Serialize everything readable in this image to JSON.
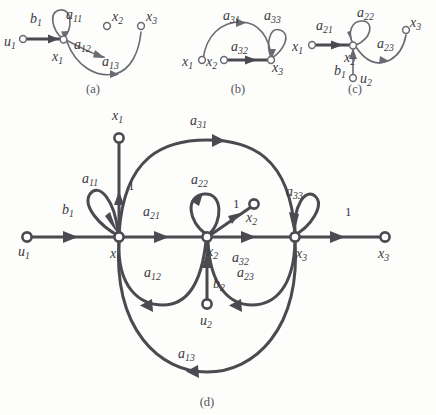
{
  "figure": {
    "background_color": "#fdfdfc",
    "edge_color": "#4a4a50",
    "text_color": "#3a3a40",
    "width": 436,
    "height": 415
  },
  "captions": {
    "a": "(a)",
    "b": "(b)",
    "c": "(c)",
    "d": "(d)"
  },
  "subfig_a": {
    "nodes": [
      {
        "id": "u1",
        "label": "u",
        "sub": "1"
      },
      {
        "id": "x1",
        "label": "x",
        "sub": "1"
      },
      {
        "id": "x2",
        "label": "x",
        "sub": "2"
      },
      {
        "id": "x3",
        "label": "x",
        "sub": "3"
      }
    ],
    "edges": [
      {
        "id": "b1",
        "label": "b",
        "sub": "1",
        "from": "u1",
        "to": "x1"
      },
      {
        "id": "a11",
        "label": "a",
        "sub": "11",
        "from": "x1",
        "to": "x1"
      },
      {
        "id": "a12",
        "label": "a",
        "sub": "12",
        "from": "x1",
        "to": "x2"
      },
      {
        "id": "a13",
        "label": "a",
        "sub": "13",
        "from": "x1",
        "to": "x3"
      }
    ]
  },
  "subfig_b": {
    "nodes": [
      {
        "id": "x1",
        "label": "x",
        "sub": "1"
      },
      {
        "id": "x2",
        "label": "x",
        "sub": "2"
      },
      {
        "id": "x3",
        "label": "x",
        "sub": "3"
      }
    ],
    "edges": [
      {
        "id": "a31",
        "label": "a",
        "sub": "31",
        "from": "x1",
        "to": "x3"
      },
      {
        "id": "a32",
        "label": "a",
        "sub": "32",
        "from": "x2",
        "to": "x3"
      },
      {
        "id": "a33",
        "label": "a",
        "sub": "33",
        "from": "x3",
        "to": "x3"
      }
    ]
  },
  "subfig_c": {
    "nodes": [
      {
        "id": "x1",
        "label": "x",
        "sub": "1"
      },
      {
        "id": "x2",
        "label": "x",
        "sub": "2"
      },
      {
        "id": "x3",
        "label": "x",
        "sub": "3"
      },
      {
        "id": "u2",
        "label": "u",
        "sub": "2"
      }
    ],
    "edges": [
      {
        "id": "a21",
        "label": "a",
        "sub": "21",
        "from": "x1",
        "to": "x2"
      },
      {
        "id": "a22",
        "label": "a",
        "sub": "22",
        "from": "x2",
        "to": "x2"
      },
      {
        "id": "a23",
        "label": "a",
        "sub": "23",
        "from": "x2",
        "to": "x3"
      },
      {
        "id": "b1",
        "label": "b",
        "sub": "1",
        "from": "u2",
        "to": "x2"
      }
    ]
  },
  "subfig_d": {
    "nodes": [
      {
        "id": "u1",
        "label": "u",
        "sub": "1"
      },
      {
        "id": "x1_node",
        "label": "x",
        "sub": "1"
      },
      {
        "id": "x2_node",
        "label": "x",
        "sub": "2"
      },
      {
        "id": "x3_node",
        "label": "x",
        "sub": "3"
      },
      {
        "id": "x1_out",
        "label": "x",
        "sub": "1"
      },
      {
        "id": "x2_out",
        "label": "x",
        "sub": "2"
      },
      {
        "id": "x3_out",
        "label": "x",
        "sub": "3"
      },
      {
        "id": "u2",
        "label": "u",
        "sub": "2"
      }
    ],
    "edges": [
      {
        "id": "b1",
        "label": "b",
        "sub": "1",
        "from": "u1",
        "to": "x1_node"
      },
      {
        "id": "a11",
        "label": "a",
        "sub": "11",
        "from": "x1_node",
        "to": "x1_node"
      },
      {
        "id": "a21",
        "label": "a",
        "sub": "21",
        "from": "x1_node",
        "to": "x2_node"
      },
      {
        "id": "a31",
        "label": "a",
        "sub": "31",
        "from": "x1_node",
        "to": "x3_node"
      },
      {
        "id": "a12",
        "label": "a",
        "sub": "12",
        "from": "x2_node",
        "to": "x1_node"
      },
      {
        "id": "a22",
        "label": "a",
        "sub": "22",
        "from": "x2_node",
        "to": "x2_node"
      },
      {
        "id": "a32",
        "label": "a",
        "sub": "32",
        "from": "x2_node",
        "to": "x3_node"
      },
      {
        "id": "a13",
        "label": "a",
        "sub": "13",
        "from": "x3_node",
        "to": "x1_node"
      },
      {
        "id": "a23",
        "label": "a",
        "sub": "23",
        "from": "x3_node",
        "to": "x2_node"
      },
      {
        "id": "a33",
        "label": "a",
        "sub": "33",
        "from": "x3_node",
        "to": "x3_node"
      },
      {
        "id": "b2",
        "label": "b",
        "sub": "2",
        "from": "u2",
        "to": "x2_node"
      }
    ],
    "unit_gains": [
      {
        "id": "g_x1",
        "label": "1"
      },
      {
        "id": "g_x2",
        "label": "1"
      },
      {
        "id": "g_x3",
        "label": "1"
      }
    ]
  }
}
